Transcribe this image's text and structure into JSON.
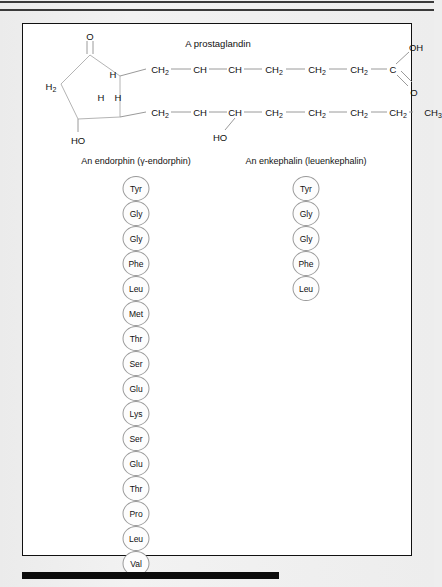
{
  "figure": {
    "prostaglandin": {
      "title": "A prostaglandin",
      "ring_labels": {
        "ketone_oxygen": "O",
        "ring_ch2": "H<sub>2</sub>",
        "ring_h_top": "H",
        "ring_h_left": "H",
        "ring_h_right": "H",
        "hydroxyl": "HO"
      },
      "upper_chain": [
        "CH2",
        "CH",
        "CH",
        "CH2",
        "CH2",
        "CH2",
        "C"
      ],
      "upper_chain_display": [
        "CH₂",
        "CH",
        "CH",
        "CH₂",
        "CH₂",
        "CH₂",
        "C"
      ],
      "lower_chain": [
        "CH2",
        "CH",
        "CH",
        "CH2",
        "CH2",
        "CH2",
        "CH2",
        "CH3"
      ],
      "lower_chain_display": [
        "CH₂",
        "CH",
        "CH",
        "CH₂",
        "CH₂",
        "CH₂",
        "CH₂",
        "CH₃"
      ],
      "carboxyl_oh": "OH",
      "carboxyl_o": "O",
      "chain_hydroxyl": "HO"
    },
    "endorphin": {
      "heading": "An endorphin (γ-endorphin)",
      "residues": [
        "Tyr",
        "Gly",
        "Gly",
        "Phe",
        "Leu",
        "Met",
        "Thr",
        "Ser",
        "Glu",
        "Lys",
        "Ser",
        "Glu",
        "Thr",
        "Pro",
        "Leu",
        "Val"
      ]
    },
    "enkephalin": {
      "heading": "An enkephalin (leuenkephalin)",
      "residues": [
        "Tyr",
        "Gly",
        "Gly",
        "Phe",
        "Leu"
      ]
    }
  },
  "colors": {
    "page_background": "#eeeeee",
    "panel_background": "#ffffff",
    "panel_border": "#111111",
    "text": "#111111",
    "bond": "#8e8e8e",
    "residue_outline": "#9a9a9a",
    "bottom_bar": "#0b0b0b"
  }
}
